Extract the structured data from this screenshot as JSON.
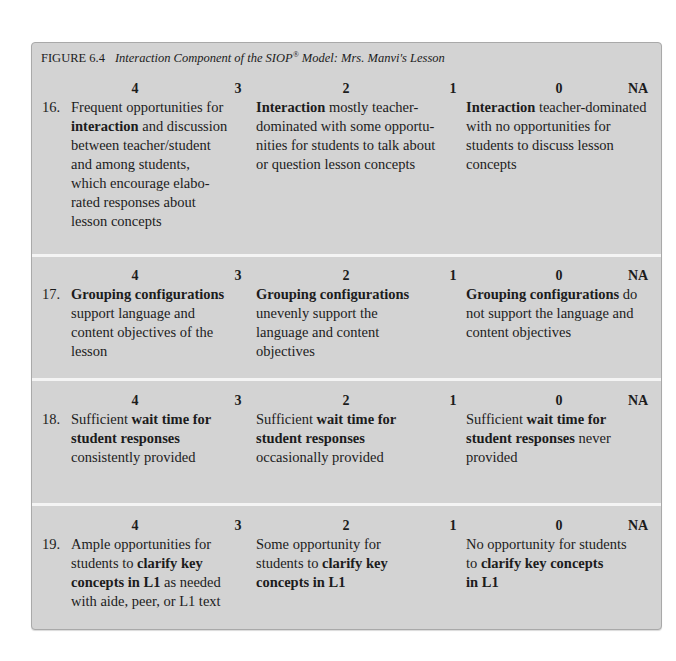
{
  "figure": {
    "label": "FIGURE 6.4",
    "title_main": "Interaction Component of the SIOP",
    "title_sup": "®",
    "title_rest": " Model: Mrs. Manvi's Lesson"
  },
  "score_labels": [
    "4",
    "3",
    "2",
    "1",
    "0",
    "NA"
  ],
  "items": [
    {
      "number": "16.",
      "high": [
        [
          "Frequent opportunities for",
          ""
        ],
        [
          "",
          "interaction",
          " and discussion"
        ],
        [
          "between teacher/student"
        ],
        [
          "and among students,"
        ],
        [
          "which encourage elabo-"
        ],
        [
          "rated responses about"
        ],
        [
          "lesson concepts"
        ]
      ],
      "mid": [
        [
          "",
          "Interaction",
          " mostly teacher-"
        ],
        [
          "dominated with some opportu-"
        ],
        [
          "nities for students to talk about"
        ],
        [
          "or question lesson concepts"
        ]
      ],
      "low": [
        [
          "",
          "Interaction",
          " teacher-dominated"
        ],
        [
          "with no opportunities for"
        ],
        [
          "students to discuss lesson"
        ],
        [
          "concepts"
        ]
      ]
    },
    {
      "number": "17.",
      "high": [
        [
          "",
          "Grouping configurations",
          ""
        ],
        [
          "support language and"
        ],
        [
          "content objectives of the"
        ],
        [
          "lesson"
        ]
      ],
      "mid": [
        [
          "",
          "Grouping configurations",
          ""
        ],
        [
          "unevenly support the"
        ],
        [
          "language and content"
        ],
        [
          "objectives"
        ]
      ],
      "low": [
        [
          "",
          "Grouping configurations",
          " do"
        ],
        [
          "not support the language and"
        ],
        [
          "content objectives"
        ]
      ]
    },
    {
      "number": "18.",
      "high": [
        [
          "Sufficient ",
          "wait time for",
          ""
        ],
        [
          "",
          "student responses",
          ""
        ],
        [
          "consistently provided"
        ]
      ],
      "mid": [
        [
          "Sufficient ",
          "wait time for",
          ""
        ],
        [
          "",
          "student responses",
          ""
        ],
        [
          "occasionally provided"
        ]
      ],
      "low": [
        [
          "Sufficient ",
          "wait time for",
          ""
        ],
        [
          "",
          "student responses",
          " never"
        ],
        [
          "provided"
        ]
      ]
    },
    {
      "number": "19.",
      "high": [
        [
          "Ample opportunities for"
        ],
        [
          "students to ",
          "clarify key",
          ""
        ],
        [
          "",
          "concepts in L1",
          " as needed"
        ],
        [
          "with aide, peer, or L1 text"
        ]
      ],
      "mid": [
        [
          "Some opportunity for"
        ],
        [
          "students to ",
          "clarify key",
          ""
        ],
        [
          "",
          "concepts in L1",
          ""
        ]
      ],
      "low": [
        [
          "No opportunity for students"
        ],
        [
          "to ",
          "clarify key concepts",
          ""
        ],
        [
          "",
          "in L1",
          ""
        ]
      ]
    }
  ],
  "colors": {
    "panel_background": "#d3d3d3",
    "separator": "#f4f4f4",
    "text": "#1c1c1c"
  }
}
